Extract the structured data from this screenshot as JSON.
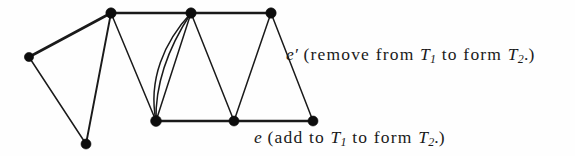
{
  "figure": {
    "type": "graph-diagram",
    "background_color": "#fefefe",
    "line_color": "#1a1a1a",
    "vertex_color": "#0d0d0d"
  },
  "captions": {
    "remove": {
      "edge_label": "e",
      "prime": "′",
      "text_before_sub1": " (remove  from ",
      "tree1": "T",
      "tree1_sub": "1",
      "text_middle": " to form ",
      "tree2": "T",
      "tree2_sub": "2",
      "text_after": ".)",
      "full_text": "e′ (remove  from T1 to form T2.)"
    },
    "add": {
      "edge_label": "e",
      "text_before_sub1": " (add  to ",
      "tree1": "T",
      "tree1_sub": "1",
      "text_middle": " to form ",
      "tree2": "T",
      "tree2_sub": "2",
      "text_after": ".)",
      "full_text": "e (add  to T1 to form T2.)"
    }
  },
  "graph": {
    "vertices": [
      {
        "id": "v-left",
        "x": 29,
        "y": 57,
        "r": 4.6
      },
      {
        "id": "v-top-1",
        "x": 111,
        "y": 13,
        "r": 5.2
      },
      {
        "id": "v-top-2",
        "x": 191,
        "y": 13,
        "r": 5.2
      },
      {
        "id": "v-top-3",
        "x": 271,
        "y": 13,
        "r": 5.2
      },
      {
        "id": "v-bottom-left",
        "x": 86,
        "y": 144,
        "r": 5.0
      },
      {
        "id": "v-bottom-1",
        "x": 156,
        "y": 121,
        "r": 5.4
      },
      {
        "id": "v-bottom-2",
        "x": 234,
        "y": 121,
        "r": 5.0
      },
      {
        "id": "v-bottom-3",
        "x": 313,
        "y": 121,
        "r": 5.0
      }
    ],
    "edges": [
      {
        "id": "edge-left-to-top1",
        "from": "v-left",
        "to": "v-top-1",
        "kind": "straight",
        "weight": "thick"
      },
      {
        "id": "edge-top1-to-top2",
        "from": "v-top-1",
        "to": "v-top-2",
        "kind": "straight",
        "weight": "thick"
      },
      {
        "id": "edge-top2-to-top3",
        "from": "v-top-2",
        "to": "v-top-3",
        "kind": "straight",
        "weight": "thick"
      },
      {
        "id": "edge-left-to-bottomleft",
        "from": "v-left",
        "to": "v-bottom-left",
        "kind": "straight",
        "weight": "thin"
      },
      {
        "id": "edge-top1-to-bottomleft",
        "from": "v-top-1",
        "to": "v-bottom-left",
        "kind": "straight",
        "weight": "med"
      },
      {
        "id": "edge-top1-to-bottom1",
        "from": "v-top-1",
        "to": "v-bottom-1",
        "kind": "straight",
        "weight": "thin"
      },
      {
        "id": "edge-top2-to-bottom1-a",
        "from": "v-top-2",
        "to": "v-bottom-1",
        "kind": "curve-outer",
        "weight": "thin"
      },
      {
        "id": "edge-top2-to-bottom1-b",
        "from": "v-top-2",
        "to": "v-bottom-1",
        "kind": "curve-inner",
        "weight": "thin"
      },
      {
        "id": "edge-top2-to-bottom1-c",
        "from": "v-top-2",
        "to": "v-bottom-1",
        "kind": "straight",
        "weight": "thin"
      },
      {
        "id": "edge-top2-to-bottom2",
        "from": "v-top-2",
        "to": "v-bottom-2",
        "kind": "straight",
        "weight": "thin"
      },
      {
        "id": "edge-top3-to-bottom2",
        "from": "v-top-3",
        "to": "v-bottom-2",
        "kind": "straight",
        "weight": "thin"
      },
      {
        "id": "edge-top3-to-bottom3",
        "from": "v-top-3",
        "to": "v-bottom-3",
        "kind": "straight",
        "weight": "thin"
      },
      {
        "id": "edge-bottom1-to-bottom2",
        "from": "v-bottom-1",
        "to": "v-bottom-2",
        "kind": "straight",
        "weight": "thick"
      },
      {
        "id": "edge-bottom2-to-bottom3",
        "from": "v-bottom-2",
        "to": "v-bottom-3",
        "kind": "straight",
        "weight": "thick"
      }
    ]
  }
}
